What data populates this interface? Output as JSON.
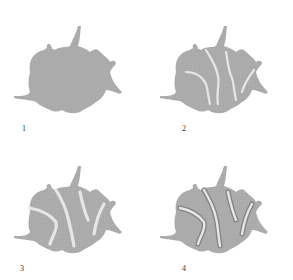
{
  "figure": {
    "panels": [
      {
        "label": "1",
        "stage": "intact cell body"
      },
      {
        "label": "2",
        "stage": "light cleavage channels forming"
      },
      {
        "label": "3",
        "stage": "channels widening"
      },
      {
        "label": "4",
        "stage": "fragments with darkened edges"
      }
    ],
    "colors": {
      "body": "#a9a9a9",
      "channel": "#e6e6e6",
      "edge": "#7a7a7a",
      "background": "#ffffff"
    }
  }
}
